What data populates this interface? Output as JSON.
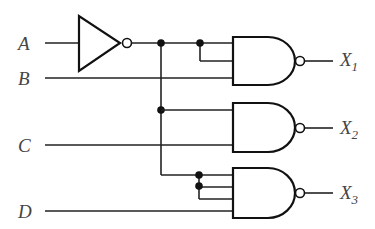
{
  "diagram": {
    "type": "logic-circuit",
    "inputs": [
      {
        "label": "A"
      },
      {
        "label": "B"
      },
      {
        "label": "C"
      },
      {
        "label": "D"
      }
    ],
    "outputs": [
      {
        "label": "X",
        "sub": "1"
      },
      {
        "label": "X",
        "sub": "2"
      },
      {
        "label": "X",
        "sub": "3"
      }
    ],
    "gates": [
      {
        "id": "inv1",
        "type": "NOT",
        "inputs": [
          "A"
        ],
        "output": "A'"
      },
      {
        "id": "nand1",
        "type": "NAND",
        "inputs": [
          "A'",
          "A'",
          "B"
        ],
        "output": "X1"
      },
      {
        "id": "nand2",
        "type": "NAND",
        "inputs": [
          "A'",
          "C"
        ],
        "output": "X2"
      },
      {
        "id": "nand3",
        "type": "NAND",
        "inputs": [
          "A'",
          "A'",
          "A'",
          "D"
        ],
        "output": "X3"
      }
    ],
    "colors": {
      "line": "#111111",
      "label": "#444444",
      "background": "#ffffff"
    }
  }
}
